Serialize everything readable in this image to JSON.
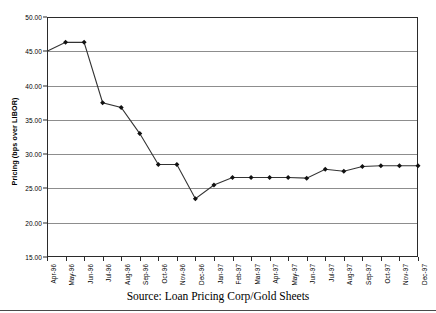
{
  "chart_data": {
    "type": "line",
    "title": "",
    "xlabel": "",
    "ylabel": "Pricing (bps over LIBOR)",
    "ylim": [
      15.0,
      50.0
    ],
    "ytick_step": 5.0,
    "ytick_labels": [
      "50.00",
      "45.00",
      "40.00",
      "35.00",
      "30.00",
      "25.00",
      "20.00",
      "15.00"
    ],
    "ytick_values": [
      50.0,
      45.0,
      40.0,
      35.0,
      30.0,
      25.0,
      20.0,
      15.0
    ],
    "grid": true,
    "grid_axis": "y",
    "legend": false,
    "marker": "filled-diamond",
    "line_color": "#333333",
    "marker_color": "#111111",
    "grid_color": "#8d8d8d",
    "frame_color": "#2b2b2b",
    "categories": [
      "Apr-96",
      "May-96",
      "Jun-96",
      "Jul-96",
      "Aug-96",
      "Sep-96",
      "Oct-96",
      "Nov-96",
      "Dec-96",
      "Jan-97",
      "Feb-97",
      "Mar-97",
      "Apr-97",
      "May-97",
      "Jun-97",
      "Jul-97",
      "Aug-97",
      "Sep-97",
      "Oct-97",
      "Nov-97",
      "Dec-97"
    ],
    "values": [
      45.0,
      46.3,
      46.3,
      37.5,
      36.8,
      33.0,
      28.5,
      28.5,
      23.5,
      25.5,
      26.6,
      26.6,
      26.6,
      26.6,
      26.5,
      27.8,
      27.5,
      28.2,
      28.3,
      28.3,
      28.3
    ]
  },
  "caption": {
    "source": "Source: Loan Pricing Corp/Gold Sheets"
  }
}
